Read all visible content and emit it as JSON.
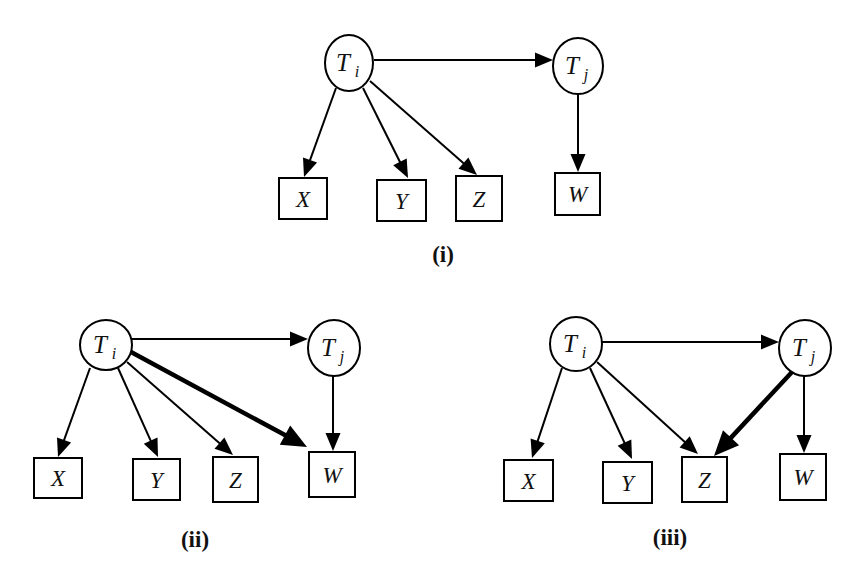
{
  "colors": {
    "stroke": "#000000",
    "background": "#ffffff",
    "text": "#111111"
  },
  "diagrams": [
    {
      "id": "i",
      "caption": "(i)",
      "caption_pos": [
        443,
        262
      ],
      "nodes": [
        {
          "id": "Ti",
          "shape": "ellipse",
          "label": "T",
          "sub": "i",
          "cx": 349,
          "cy": 63,
          "rx": 24,
          "ry": 28
        },
        {
          "id": "Tj",
          "shape": "ellipse",
          "label": "T",
          "sub": "j",
          "cx": 578,
          "cy": 66,
          "rx": 25,
          "ry": 28
        },
        {
          "id": "X",
          "shape": "box",
          "label": "X",
          "x": 279,
          "y": 178,
          "w": 48,
          "h": 41
        },
        {
          "id": "Y",
          "shape": "box",
          "label": "Y",
          "x": 377,
          "y": 180,
          "w": 49,
          "h": 41
        },
        {
          "id": "Z",
          "shape": "box",
          "label": "Z",
          "x": 456,
          "y": 176,
          "w": 46,
          "h": 45
        },
        {
          "id": "W",
          "shape": "box",
          "label": "W",
          "x": 555,
          "y": 173,
          "w": 45,
          "h": 42
        }
      ],
      "edges": [
        {
          "from": "Ti",
          "to": "Tj",
          "x1": 374,
          "y1": 60,
          "x2": 553,
          "y2": 60,
          "thick": false
        },
        {
          "from": "Ti",
          "to": "X",
          "x1": 336,
          "y1": 88,
          "x2": 304,
          "y2": 177,
          "thick": false
        },
        {
          "from": "Ti",
          "to": "Y",
          "x1": 363,
          "y1": 88,
          "x2": 408,
          "y2": 178,
          "thick": false
        },
        {
          "from": "Ti",
          "to": "Z",
          "x1": 370,
          "y1": 81,
          "x2": 477,
          "y2": 175,
          "thick": false
        },
        {
          "from": "Tj",
          "to": "W",
          "x1": 578,
          "y1": 94,
          "x2": 578,
          "y2": 172,
          "thick": false
        }
      ]
    },
    {
      "id": "ii",
      "caption": "(ii)",
      "caption_pos": [
        195,
        547
      ],
      "nodes": [
        {
          "id": "Ti",
          "shape": "ellipse",
          "label": "T",
          "sub": "i",
          "cx": 106,
          "cy": 345,
          "rx": 26,
          "ry": 25
        },
        {
          "id": "Tj",
          "shape": "ellipse",
          "label": "T",
          "sub": "j",
          "cx": 334,
          "cy": 348,
          "rx": 26,
          "ry": 28
        },
        {
          "id": "X",
          "shape": "box",
          "label": "X",
          "x": 34,
          "y": 458,
          "w": 48,
          "h": 40
        },
        {
          "id": "Y",
          "shape": "box",
          "label": "Y",
          "x": 133,
          "y": 459,
          "w": 47,
          "h": 41
        },
        {
          "id": "Z",
          "shape": "box",
          "label": "Z",
          "x": 213,
          "y": 457,
          "w": 45,
          "h": 45
        },
        {
          "id": "W",
          "shape": "box",
          "label": "W",
          "x": 309,
          "y": 452,
          "w": 46,
          "h": 45
        }
      ],
      "edges": [
        {
          "from": "Ti",
          "to": "Tj",
          "x1": 132,
          "y1": 339,
          "x2": 308,
          "y2": 339,
          "thick": false
        },
        {
          "from": "Ti",
          "to": "X",
          "x1": 90,
          "y1": 368,
          "x2": 58,
          "y2": 457,
          "thick": false
        },
        {
          "from": "Ti",
          "to": "Y",
          "x1": 118,
          "y1": 368,
          "x2": 158,
          "y2": 457,
          "thick": false
        },
        {
          "from": "Ti",
          "to": "Z",
          "x1": 127,
          "y1": 362,
          "x2": 233,
          "y2": 455,
          "thick": false
        },
        {
          "from": "Ti",
          "to": "W",
          "x1": 131,
          "y1": 352,
          "x2": 307,
          "y2": 447,
          "thick": true
        },
        {
          "from": "Tj",
          "to": "W",
          "x1": 333,
          "y1": 376,
          "x2": 333,
          "y2": 451,
          "thick": false
        }
      ]
    },
    {
      "id": "iii",
      "caption": "(iii)",
      "caption_pos": [
        670,
        545
      ],
      "nodes": [
        {
          "id": "Ti",
          "shape": "ellipse",
          "label": "T",
          "sub": "i",
          "cx": 576,
          "cy": 344,
          "rx": 26,
          "ry": 27
        },
        {
          "id": "Tj",
          "shape": "ellipse",
          "label": "T",
          "sub": "j",
          "cx": 805,
          "cy": 348,
          "rx": 26,
          "ry": 28
        },
        {
          "id": "X",
          "shape": "box",
          "label": "X",
          "x": 504,
          "y": 460,
          "w": 49,
          "h": 41
        },
        {
          "id": "Y",
          "shape": "box",
          "label": "Y",
          "x": 603,
          "y": 462,
          "w": 49,
          "h": 41
        },
        {
          "id": "Z",
          "shape": "box",
          "label": "Z",
          "x": 682,
          "y": 457,
          "w": 45,
          "h": 45
        },
        {
          "id": "W",
          "shape": "box",
          "label": "W",
          "x": 780,
          "y": 454,
          "w": 46,
          "h": 46
        }
      ],
      "edges": [
        {
          "from": "Ti",
          "to": "Tj",
          "x1": 602,
          "y1": 342,
          "x2": 779,
          "y2": 342,
          "thick": false
        },
        {
          "from": "Ti",
          "to": "X",
          "x1": 562,
          "y1": 368,
          "x2": 532,
          "y2": 458,
          "thick": false
        },
        {
          "from": "Ti",
          "to": "Y",
          "x1": 590,
          "y1": 368,
          "x2": 632,
          "y2": 459,
          "thick": false
        },
        {
          "from": "Ti",
          "to": "Z",
          "x1": 597,
          "y1": 362,
          "x2": 698,
          "y2": 454,
          "thick": false
        },
        {
          "from": "Tj",
          "to": "Z",
          "x1": 792,
          "y1": 372,
          "x2": 714,
          "y2": 456,
          "thick": true
        },
        {
          "from": "Tj",
          "to": "W",
          "x1": 804,
          "y1": 376,
          "x2": 804,
          "y2": 453,
          "thick": false
        }
      ]
    }
  ]
}
